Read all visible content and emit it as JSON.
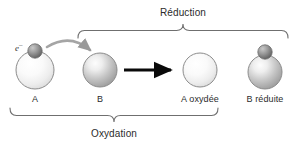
{
  "diagram": {
    "title_top": "Réduction",
    "title_bottom": "Oxydation",
    "electron_label": "e",
    "electron_charge": "–",
    "species": [
      {
        "id": "a",
        "label": "A",
        "x": 35,
        "y": 70,
        "r": 19,
        "fill": "pale",
        "has_electron": true,
        "label_x": 35,
        "label_y": 99
      },
      {
        "id": "b",
        "label": "B",
        "x": 100,
        "y": 70,
        "r": 17,
        "fill": "gray",
        "has_electron": false,
        "label_x": 100,
        "label_y": 99
      },
      {
        "id": "a-oxydee",
        "label": "A oxydée",
        "x": 200,
        "y": 70,
        "r": 17,
        "fill": "pale",
        "has_electron": false,
        "label_x": 200,
        "label_y": 99
      },
      {
        "id": "b-reduite",
        "label": "B réduite",
        "x": 265,
        "y": 72,
        "r": 17,
        "fill": "gray",
        "has_electron": true,
        "label_x": 265,
        "label_y": 99
      }
    ],
    "brackets": {
      "reduction": {
        "x_start": 78,
        "x_end": 288,
        "y": 30,
        "peak_x": 183,
        "opens": "down"
      },
      "oxydation": {
        "x_start": 10,
        "x_end": 218,
        "y": 116,
        "peak_x": 114,
        "opens": "up"
      }
    },
    "reaction_arrow": {
      "x_start": 124,
      "x_end": 176,
      "y": 70
    },
    "transfer_arrow": {
      "from_x": 48,
      "from_y": 48,
      "to_x": 93,
      "to_y": 54,
      "label": "electron-transfer"
    },
    "colors": {
      "text": "#2b2b2b",
      "bracket": "#6f6f6f",
      "arrow_reaction": "#0a0a0a",
      "arrow_transfer": "#9a9a9a",
      "sphere_outline": "#8c8c8c",
      "sphere_pale_light": "#ffffff",
      "sphere_pale_dark": "#dcdcdc",
      "sphere_gray_light": "#f2f2f2",
      "sphere_gray_dark": "#9d9d9d",
      "electron_light": "#b9b9b9",
      "electron_dark": "#5d5d5d",
      "background": "#ffffff"
    }
  }
}
